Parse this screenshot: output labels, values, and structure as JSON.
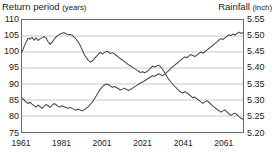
{
  "left_axis": {
    "title_main": "Return period",
    "title_unit": "(years)",
    "ticks": [
      "110",
      "105",
      "100",
      "95",
      "90",
      "85",
      "80",
      "75"
    ]
  },
  "right_axis": {
    "title_main": "Rainfall",
    "title_unit": "(inch)",
    "ticks": [
      "5.55",
      "5.50",
      "5.45",
      "5.40",
      "5.35",
      "5.30",
      "5.25",
      "5.20"
    ]
  },
  "x_axis": {
    "ticks": [
      "1961",
      "1981",
      "2001",
      "2021",
      "2041",
      "2061"
    ]
  },
  "colors": {
    "line": "#4d4d4d",
    "frame": "#6b6b6b",
    "grid": "#c8c8c8",
    "background": "#ffffff"
  },
  "chart_data": {
    "type": "line",
    "title": "",
    "xlabel": "",
    "ylabel": "Return period (years)",
    "y2label": "Rainfall (inch)",
    "grid": true,
    "legend": "none",
    "xlim": [
      1961,
      2071
    ],
    "ylim": [
      75,
      110
    ],
    "y2lim": [
      5.2,
      5.55
    ],
    "yticks": [
      75,
      80,
      85,
      90,
      95,
      100,
      105,
      110
    ],
    "y2ticks": [
      5.2,
      5.25,
      5.3,
      5.35,
      5.4,
      5.45,
      5.5,
      5.55
    ],
    "xticks": [
      1961,
      1981,
      2001,
      2021,
      2041,
      2061
    ],
    "x": [
      1961,
      1962,
      1963,
      1964,
      1965,
      1966,
      1967,
      1968,
      1969,
      1970,
      1971,
      1972,
      1973,
      1974,
      1975,
      1976,
      1977,
      1978,
      1979,
      1980,
      1981,
      1982,
      1983,
      1984,
      1985,
      1986,
      1987,
      1988,
      1989,
      1990,
      1991,
      1992,
      1993,
      1994,
      1995,
      1996,
      1997,
      1998,
      1999,
      2000,
      2001,
      2002,
      2003,
      2004,
      2005,
      2006,
      2007,
      2008,
      2009,
      2010,
      2011,
      2012,
      2013,
      2014,
      2015,
      2016,
      2017,
      2018,
      2019,
      2020,
      2021,
      2022,
      2023,
      2024,
      2025,
      2026,
      2027,
      2028,
      2029,
      2030,
      2031,
      2032,
      2033,
      2034,
      2035,
      2036,
      2037,
      2038,
      2039,
      2040,
      2041,
      2042,
      2043,
      2044,
      2045,
      2046,
      2047,
      2048,
      2049,
      2050,
      2051,
      2052,
      2053,
      2054,
      2055,
      2056,
      2057,
      2058,
      2059,
      2060,
      2061,
      2062,
      2063,
      2064,
      2065,
      2066,
      2067,
      2068,
      2069,
      2070,
      2071
    ],
    "series": [
      {
        "name": "Return period",
        "axis": "left",
        "unit": "years",
        "values": [
          100.0,
          101.6,
          103.0,
          104.3,
          104.0,
          104.6,
          103.7,
          104.4,
          103.6,
          104.1,
          104.5,
          104.8,
          104.4,
          103.2,
          102.4,
          103.1,
          104.0,
          104.7,
          105.2,
          105.6,
          105.9,
          106.0,
          105.7,
          105.4,
          105.5,
          105.2,
          104.6,
          104.0,
          103.1,
          102.0,
          100.6,
          99.2,
          98.2,
          97.4,
          96.9,
          97.2,
          97.9,
          98.6,
          99.3,
          99.9,
          99.4,
          99.8,
          100.2,
          100.0,
          99.5,
          99.8,
          99.4,
          98.9,
          98.4,
          97.9,
          97.5,
          97.0,
          96.5,
          96.0,
          95.7,
          95.2,
          94.8,
          94.4,
          94.0,
          93.6,
          93.8,
          93.5,
          93.8,
          94.3,
          95.0,
          95.6,
          95.3,
          95.6,
          95.9,
          95.4,
          94.6,
          93.6,
          92.5,
          91.5,
          90.7,
          90.0,
          89.3,
          88.6,
          88.0,
          87.5,
          87.2,
          87.6,
          87.3,
          86.8,
          86.2,
          85.7,
          85.9,
          85.4,
          84.9,
          84.4,
          84.0,
          84.4,
          84.8,
          84.3,
          83.7,
          83.1,
          82.6,
          82.1,
          81.7,
          81.2,
          81.6,
          81.9,
          81.3,
          80.7,
          80.2,
          80.6,
          80.9,
          80.4,
          79.8,
          79.3,
          79.0
        ]
      },
      {
        "name": "Rainfall",
        "axis": "right",
        "unit": "inch",
        "values": [
          5.3065,
          5.3,
          5.294,
          5.289,
          5.293,
          5.287,
          5.282,
          5.278,
          5.284,
          5.279,
          5.274,
          5.28,
          5.286,
          5.282,
          5.277,
          5.283,
          5.289,
          5.285,
          5.28,
          5.278,
          5.282,
          5.279,
          5.276,
          5.274,
          5.277,
          5.273,
          5.27,
          5.268,
          5.272,
          5.269,
          5.266,
          5.27,
          5.274,
          5.279,
          5.286,
          5.294,
          5.303,
          5.313,
          5.324,
          5.334,
          5.342,
          5.347,
          5.35,
          5.348,
          5.344,
          5.34,
          5.342,
          5.339,
          5.335,
          5.331,
          5.334,
          5.337,
          5.333,
          5.33,
          5.333,
          5.337,
          5.341,
          5.345,
          5.349,
          5.353,
          5.356,
          5.36,
          5.364,
          5.368,
          5.372,
          5.376,
          5.374,
          5.378,
          5.382,
          5.379,
          5.376,
          5.38,
          5.386,
          5.392,
          5.398,
          5.404,
          5.409,
          5.414,
          5.419,
          5.424,
          5.43,
          5.435,
          5.432,
          5.437,
          5.442,
          5.439,
          5.436,
          5.44,
          5.445,
          5.45,
          5.446,
          5.451,
          5.456,
          5.461,
          5.466,
          5.471,
          5.476,
          5.481,
          5.487,
          5.492,
          5.489,
          5.494,
          5.499,
          5.504,
          5.501,
          5.506,
          5.503,
          5.508,
          5.512,
          5.508,
          5.511
        ]
      }
    ]
  }
}
